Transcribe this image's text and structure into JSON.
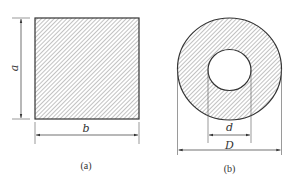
{
  "figure_a": {
    "shape": "solid-square-cross-section",
    "width_label": "b",
    "height_label": "a",
    "caption": "(a)"
  },
  "figure_b": {
    "shape": "hollow-circular-cross-section",
    "inner_diameter_label": "d",
    "outer_diameter_label": "D",
    "caption": "(b)"
  },
  "colors": {
    "line": "#333333",
    "hatch": "#555555",
    "background": "#ffffff"
  }
}
